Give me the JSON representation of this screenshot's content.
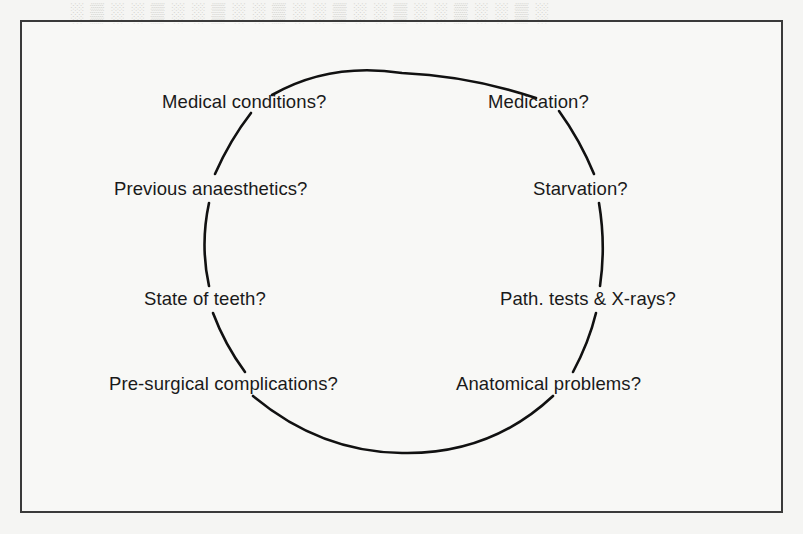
{
  "diagram": {
    "type": "cycle",
    "shape": "circle",
    "nodes": [
      {
        "id": "medical_conditions",
        "label": "Medical conditions?",
        "position": "top-left"
      },
      {
        "id": "medication",
        "label": "Medication?",
        "position": "top-right"
      },
      {
        "id": "previous_anaesthetics",
        "label": "Previous anaesthetics?",
        "position": "upper-left"
      },
      {
        "id": "starvation",
        "label": "Starvation?",
        "position": "upper-right"
      },
      {
        "id": "state_of_teeth",
        "label": "State of teeth?",
        "position": "lower-left"
      },
      {
        "id": "path_tests",
        "label": "Path. tests & X-rays?",
        "position": "lower-right"
      },
      {
        "id": "pre_surgical",
        "label": "Pre-surgical complications?",
        "position": "bottom-left"
      },
      {
        "id": "anatomical",
        "label": "Anatomical problems?",
        "position": "bottom-right"
      }
    ],
    "colors": {
      "stroke": "#111111",
      "text": "#1a1a1a",
      "frame": "#3a3a3a",
      "paper": "#f5f5f3"
    }
  }
}
